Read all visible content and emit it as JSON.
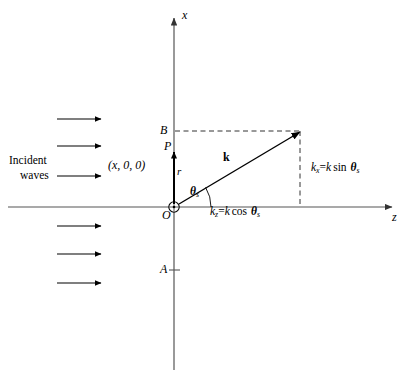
{
  "figure": {
    "type": "vector-diagram",
    "background_color": "#ffffff",
    "line_color": "#000000",
    "axis_color": "#555555"
  },
  "axes": {
    "x_axis_label": "x",
    "z_axis_label": "z",
    "origin_label": "O",
    "origin_marker": "circle-dot-icon"
  },
  "incident": {
    "line1": "Incident",
    "line2": "waves",
    "arrow_count": 6,
    "arrows": [
      {
        "name": "incident-arrow-1",
        "y": 119
      },
      {
        "name": "incident-arrow-2",
        "y": 146
      },
      {
        "name": "incident-arrow-3",
        "y": 176
      },
      {
        "name": "incident-arrow-4",
        "y": 226
      },
      {
        "name": "incident-arrow-5",
        "y": 254
      },
      {
        "name": "incident-arrow-6",
        "y": 283
      }
    ]
  },
  "points": {
    "P": "P",
    "P_coords": "(x, 0, 0)",
    "A": "A",
    "B": "B",
    "r": "r"
  },
  "vectors": {
    "k_label": "k",
    "angle_symbol": "θ",
    "angle_subscript": "s"
  },
  "components": {
    "kz": {
      "symbol": "k",
      "symbol_sub": "z",
      "equals": "=",
      "rhs_k": "k",
      "rhs_fn": "cos",
      "rhs_theta": "θ",
      "rhs_theta_sub": "s",
      "full": "k_z = k cos θ_s"
    },
    "kx": {
      "symbol": "k",
      "symbol_sub": "x",
      "equals": "=",
      "rhs_k": "k",
      "rhs_fn": "sin",
      "rhs_theta": "θ",
      "rhs_theta_sub": "s",
      "full": "k_x = k sin θ_s"
    }
  }
}
